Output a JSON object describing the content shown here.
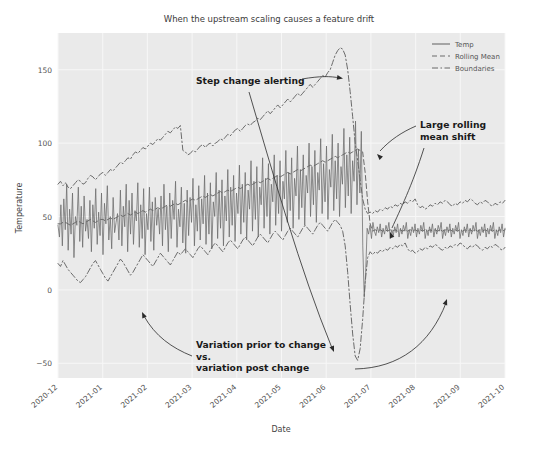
{
  "chart_data": {
    "type": "line",
    "title": "When the upstream scaling causes a feature drift",
    "xlabel": "Date",
    "ylabel": "Temperature",
    "grid": true,
    "legend_position": "upper right",
    "xlim": [
      "2020-12",
      "2021-10"
    ],
    "ylim": [
      -60,
      175
    ],
    "yticks": [
      -50,
      0,
      50,
      100,
      150
    ],
    "ytick_labels": [
      "−50",
      "0",
      "50",
      "100",
      "150"
    ],
    "xticks": [
      "2020-12",
      "2021-01",
      "2021-02",
      "2021-03",
      "2021-04",
      "2021-05",
      "2021-06",
      "2021-07",
      "2021-08",
      "2021-09",
      "2021-10"
    ],
    "legend": [
      {
        "label": "Temp",
        "style": "solid",
        "color": "#6a6a6a"
      },
      {
        "label": "Rolling Mean",
        "style": "dashed",
        "color": "#6a6a6a"
      },
      {
        "label": "Boundaries",
        "style": "dashdot",
        "color": "#6a6a6a"
      }
    ],
    "series": [
      {
        "name": "Temp",
        "style": "solid",
        "note": "noisy daily temperature; drifts upward until 2021-06 step change then collapses to a tight band near 40",
        "values": [
          44,
          36,
          58,
          30,
          62,
          41,
          72,
          27,
          55,
          38,
          66,
          22,
          50,
          44,
          70,
          33,
          57,
          29,
          64,
          40,
          48,
          35,
          61,
          26,
          58,
          42,
          69,
          31,
          53,
          37,
          66,
          24,
          59,
          45,
          71,
          34,
          50,
          28,
          63,
          39,
          46,
          52,
          34,
          68,
          30,
          57,
          43,
          72,
          26,
          61,
          38,
          66,
          31,
          54,
          47,
          73,
          29,
          58,
          35,
          69,
          24,
          52,
          41,
          70,
          33,
          60,
          27,
          63,
          44,
          55,
          38,
          64,
          30,
          72,
          41,
          57,
          26,
          66,
          35,
          61,
          48,
          74,
          29,
          55,
          43,
          70,
          32,
          59,
          25,
          68,
          37,
          63,
          46,
          76,
          30,
          58,
          40,
          71,
          34,
          62,
          45,
          78,
          31,
          66,
          38,
          73,
          28,
          60,
          50,
          80,
          35,
          68,
          42,
          75,
          30,
          64,
          47,
          82,
          36,
          70,
          44,
          78,
          33,
          66,
          52,
          85,
          38,
          72,
          46,
          80,
          34,
          68,
          55,
          88,
          40,
          74,
          48,
          84,
          36,
          70,
          58,
          90,
          42,
          76,
          50,
          86,
          38,
          72,
          60,
          92,
          44,
          78,
          52,
          88,
          40,
          74,
          62,
          95,
          46,
          80,
          54,
          90,
          42,
          76,
          64,
          98,
          48,
          82,
          56,
          92,
          44,
          78,
          66,
          100,
          50,
          84,
          58,
          95,
          46,
          80,
          68,
          103,
          52,
          86,
          60,
          98,
          48,
          82,
          70,
          106,
          54,
          88,
          62,
          100,
          50,
          84,
          72,
          110,
          56,
          92,
          64,
          104,
          52,
          88,
          74,
          115,
          58,
          96,
          66,
          108,
          30,
          -5,
          12,
          42,
          38,
          44,
          35,
          46,
          40,
          37,
          43,
          39,
          45,
          36,
          42,
          38,
          44,
          40,
          46,
          35,
          41,
          37,
          43,
          39,
          45,
          36,
          42,
          38,
          44,
          40,
          46,
          35,
          41,
          37,
          43,
          39,
          45,
          36,
          42,
          38,
          44,
          40,
          46,
          35,
          41,
          37,
          43,
          39,
          45,
          36,
          42,
          38,
          44,
          40,
          46,
          35,
          41,
          37,
          43,
          39,
          45,
          36,
          42,
          38,
          44,
          40,
          46,
          35,
          41,
          37,
          43,
          39,
          45,
          36,
          42,
          38,
          44,
          40,
          46,
          35,
          41,
          37,
          43,
          39,
          45,
          36,
          42,
          38,
          44,
          40,
          46,
          35,
          41,
          37,
          43,
          39,
          45,
          36,
          42
        ]
      },
      {
        "name": "Rolling Mean",
        "style": "dashed",
        "note": "30-day rolling mean rising slowly from ~45 to ~95, then stepping down sharply to ~40",
        "values": [
          45,
          45,
          46,
          46,
          45,
          44,
          45,
          46,
          47,
          46,
          45,
          46,
          47,
          48,
          47,
          46,
          47,
          48,
          48,
          47,
          48,
          49,
          48,
          49,
          50,
          51,
          50,
          51,
          52,
          51,
          52,
          53,
          52,
          53,
          54,
          53,
          54,
          55,
          54,
          55,
          56,
          55,
          56,
          57,
          58,
          57,
          58,
          59,
          58,
          59,
          60,
          61,
          60,
          61,
          62,
          61,
          62,
          63,
          64,
          63,
          64,
          65,
          64,
          65,
          66,
          67,
          66,
          67,
          68,
          67,
          68,
          69,
          70,
          69,
          70,
          71,
          72,
          71,
          72,
          73,
          74,
          73,
          74,
          75,
          76,
          75,
          76,
          77,
          78,
          77,
          78,
          79,
          80,
          79,
          80,
          81,
          82,
          81,
          82,
          83,
          84,
          85,
          84,
          85,
          86,
          87,
          88,
          87,
          88,
          89,
          90,
          91,
          90,
          91,
          92,
          93,
          94,
          93,
          94,
          95,
          96,
          95,
          94,
          80,
          60,
          45,
          40,
          41,
          40,
          41,
          40,
          41,
          40,
          41,
          40,
          41,
          40,
          41,
          40,
          41,
          40,
          41,
          40,
          41,
          40,
          41,
          40,
          41,
          40,
          41,
          40,
          41,
          40,
          41,
          40,
          41,
          40,
          41,
          40,
          41,
          40,
          41,
          40,
          41,
          40,
          41,
          40,
          41,
          40,
          41,
          40,
          41,
          40,
          41,
          40,
          41,
          40,
          41,
          40,
          41
        ]
      },
      {
        "name": "Upper Boundary",
        "style": "dashdot",
        "note": "mean + k*rolling std; wide (~70-120) pre-change, spikes to ~165 at the step, then narrow (~50-60) post-change",
        "values": [
          72,
          74,
          71,
          73,
          70,
          69,
          71,
          73,
          75,
          74,
          72,
          73,
          76,
          78,
          77,
          75,
          77,
          79,
          80,
          78,
          80,
          82,
          81,
          83,
          85,
          87,
          86,
          88,
          90,
          89,
          92,
          94,
          93,
          95,
          97,
          96,
          98,
          100,
          99,
          101,
          103,
          102,
          104,
          106,
          108,
          107,
          109,
          111,
          110,
          112,
          95,
          94,
          92,
          93,
          95,
          94,
          96,
          98,
          99,
          97,
          99,
          100,
          98,
          100,
          101,
          103,
          102,
          104,
          106,
          105,
          107,
          109,
          110,
          108,
          110,
          112,
          113,
          112,
          114,
          115,
          117,
          116,
          118,
          120,
          122,
          120,
          122,
          124,
          126,
          124,
          126,
          128,
          130,
          128,
          130,
          132,
          134,
          132,
          134,
          136,
          138,
          140,
          138,
          140,
          142,
          144,
          146,
          145,
          148,
          150,
          155,
          160,
          163,
          165,
          164,
          160,
          150,
          135,
          118,
          100,
          88,
          75,
          62,
          55,
          52,
          53,
          52,
          54,
          53,
          55,
          54,
          56,
          55,
          57,
          56,
          58,
          57,
          59,
          58,
          60,
          59,
          61,
          60,
          62,
          58,
          56,
          57,
          55,
          56,
          58,
          57,
          59,
          58,
          60,
          59,
          61,
          60,
          58,
          57,
          59,
          58,
          60,
          59,
          61,
          60,
          62,
          61,
          59,
          58,
          60,
          59,
          61,
          60,
          58,
          57,
          59,
          58,
          60,
          59,
          61
        ]
      },
      {
        "name": "Lower Boundary",
        "style": "dashdot",
        "note": "mean - k*rolling std; dips to ~5 pre-change, plunges to ~-48 at the step, then narrow (~22-32) post-change",
        "values": [
          18,
          16,
          20,
          17,
          14,
          12,
          10,
          8,
          6,
          5,
          7,
          9,
          12,
          15,
          18,
          20,
          17,
          14,
          11,
          8,
          6,
          9,
          12,
          15,
          18,
          21,
          19,
          16,
          13,
          10,
          12,
          15,
          18,
          21,
          24,
          22,
          20,
          18,
          16,
          19,
          22,
          25,
          23,
          21,
          19,
          17,
          20,
          23,
          26,
          24,
          26,
          28,
          26,
          24,
          22,
          25,
          28,
          30,
          28,
          26,
          24,
          27,
          30,
          32,
          30,
          28,
          26,
          29,
          32,
          34,
          32,
          30,
          28,
          31,
          34,
          36,
          34,
          32,
          30,
          33,
          36,
          38,
          36,
          34,
          32,
          35,
          38,
          40,
          38,
          36,
          34,
          37,
          40,
          42,
          40,
          38,
          36,
          39,
          42,
          44,
          42,
          40,
          38,
          41,
          44,
          46,
          44,
          42,
          40,
          43,
          46,
          48,
          46,
          44,
          40,
          30,
          12,
          -10,
          -30,
          -45,
          -48,
          -40,
          -20,
          5,
          22,
          26,
          24,
          26,
          25,
          27,
          26,
          28,
          27,
          29,
          28,
          30,
          29,
          31,
          30,
          32,
          28,
          26,
          27,
          25,
          26,
          28,
          27,
          29,
          28,
          30,
          29,
          31,
          30,
          28,
          27,
          29,
          28,
          30,
          29,
          31,
          30,
          32,
          31,
          29,
          28,
          30,
          29,
          31,
          30,
          28,
          27,
          29,
          28,
          30,
          29,
          31,
          30,
          28,
          27,
          29
        ]
      }
    ],
    "annotations": [
      {
        "name": "step-change-alerting",
        "lines": [
          "Step change alerting"
        ]
      },
      {
        "name": "large-rolling-mean-shift",
        "lines": [
          "Large rolling",
          "mean shift"
        ]
      },
      {
        "name": "variation-comparison",
        "lines": [
          "Variation prior to change",
          "vs.",
          "variation post change"
        ]
      }
    ],
    "colors": {
      "plot_background": "#eaeaea",
      "grid": "#f7f7f7",
      "line": "#6a6a6a",
      "annotation_text": "#1a1a1a",
      "title_text": "#3b3b3b"
    }
  }
}
